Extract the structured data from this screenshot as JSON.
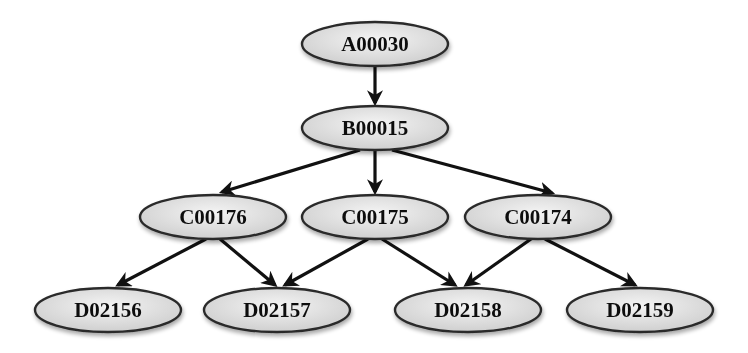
{
  "diagram": {
    "type": "tree",
    "colors": {
      "node_fill_light": "#f4f4f4",
      "node_fill_dark": "#cfcfcf",
      "node_stroke": "#2a2a2a",
      "edge": "#111111",
      "background": "#ffffff"
    },
    "nodes": [
      {
        "id": "A00030",
        "label": "A00030",
        "level": 0,
        "cx": 375,
        "cy": 44
      },
      {
        "id": "B00015",
        "label": "B00015",
        "level": 1,
        "cx": 375,
        "cy": 128
      },
      {
        "id": "C00176",
        "label": "C00176",
        "level": 2,
        "cx": 213,
        "cy": 217
      },
      {
        "id": "C00175",
        "label": "C00175",
        "level": 2,
        "cx": 375,
        "cy": 217
      },
      {
        "id": "C00174",
        "label": "C00174",
        "level": 2,
        "cx": 538,
        "cy": 217
      },
      {
        "id": "D02156",
        "label": "D02156",
        "level": 3,
        "cx": 108,
        "cy": 310
      },
      {
        "id": "D02157",
        "label": "D02157",
        "level": 3,
        "cx": 277,
        "cy": 310
      },
      {
        "id": "D02158",
        "label": "D02158",
        "level": 3,
        "cx": 468,
        "cy": 310
      },
      {
        "id": "D02159",
        "label": "D02159",
        "level": 3,
        "cx": 640,
        "cy": 310
      }
    ],
    "edges": [
      {
        "from": "A00030",
        "to": "B00015"
      },
      {
        "from": "B00015",
        "to": "C00176"
      },
      {
        "from": "B00015",
        "to": "C00175"
      },
      {
        "from": "B00015",
        "to": "C00174"
      },
      {
        "from": "C00176",
        "to": "D02156"
      },
      {
        "from": "C00176",
        "to": "D02157"
      },
      {
        "from": "C00175",
        "to": "D02157"
      },
      {
        "from": "C00175",
        "to": "D02158"
      },
      {
        "from": "C00174",
        "to": "D02158"
      },
      {
        "from": "C00174",
        "to": "D02159"
      }
    ]
  }
}
